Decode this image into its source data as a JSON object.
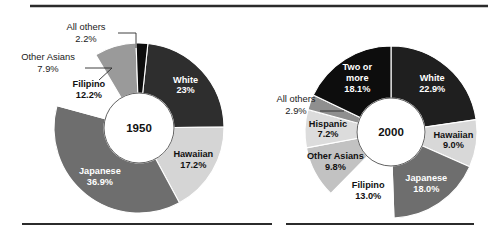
{
  "figure": {
    "name": "hawaii-race-composition-donuts",
    "background": "#ffffff",
    "rule_color": "#2b2b2b",
    "top_rule": true,
    "bottom_rule": true
  },
  "chart_data": [
    {
      "type": "pie",
      "title": "1950",
      "center_label": "1950",
      "xlabel": "",
      "ylabel": "",
      "legend": "none",
      "grid": false,
      "donut": true,
      "categories": [
        "White",
        "Hawaiian",
        "Japanese",
        "Filipino",
        "Other Asians",
        "All others"
      ],
      "values": [
        23.0,
        17.2,
        36.9,
        12.2,
        7.9,
        2.2
      ],
      "labels": [
        {
          "name": "White",
          "value": "23%",
          "placement": "inside",
          "fill": "#2e2e2e",
          "text": "#ffffff"
        },
        {
          "name": "Hawaiian",
          "value": "17.2%",
          "placement": "inside",
          "fill": "#d5d5d5",
          "text": "#111111"
        },
        {
          "name": "Japanese",
          "value": "36.9%",
          "placement": "inside",
          "fill": "#6e6e6e",
          "text": "#ffffff"
        },
        {
          "name": "Filipino",
          "value": "12.2%",
          "placement": "inside",
          "fill": "#ffffff",
          "text": "#111111"
        },
        {
          "name": "Other Asians",
          "value": "7.9%",
          "placement": "outside",
          "fill": "#9a9a9a",
          "text": "#1a1a1a"
        },
        {
          "name": "All others",
          "value": "2.2%",
          "placement": "outside",
          "fill": "#0d0d0d",
          "text": "#1a1a1a"
        }
      ]
    },
    {
      "type": "pie",
      "title": "2000",
      "center_label": "2000",
      "xlabel": "",
      "ylabel": "",
      "legend": "none",
      "grid": false,
      "donut": true,
      "categories": [
        "White",
        "Hawaiian",
        "Japanese",
        "Filipino",
        "Other Asians",
        "Hispanic",
        "All others",
        "Two or more"
      ],
      "values": [
        22.9,
        9.0,
        18.0,
        13.0,
        9.8,
        7.2,
        2.9,
        18.1
      ],
      "labels": [
        {
          "name": "White",
          "value": "22.9%",
          "placement": "inside",
          "fill": "#1f1f1f",
          "text": "#ffffff"
        },
        {
          "name": "Hawaiian",
          "value": "9.0%",
          "placement": "inside",
          "fill": "#d8d8d8",
          "text": "#111111"
        },
        {
          "name": "Japanese",
          "value": "18.0%",
          "placement": "inside",
          "fill": "#6e6e6e",
          "text": "#ffffff"
        },
        {
          "name": "Filipino",
          "value": "13.0%",
          "placement": "inside",
          "fill": "#ffffff",
          "text": "#111111"
        },
        {
          "name": "Other Asians",
          "value": "9.8%",
          "placement": "inside",
          "fill": "#c2c2c2",
          "text": "#111111"
        },
        {
          "name": "Hispanic",
          "value": "7.2%",
          "placement": "inside",
          "fill": "#dcdcdc",
          "text": "#111111"
        },
        {
          "name": "All others",
          "value": "2.9%",
          "placement": "outside",
          "fill": "#8f8f8f",
          "text": "#1a1a1a"
        },
        {
          "name": "Two or more",
          "value": "18.1%",
          "placement": "inside",
          "fill": "#0d0d0d",
          "text": "#ffffff"
        }
      ]
    }
  ]
}
